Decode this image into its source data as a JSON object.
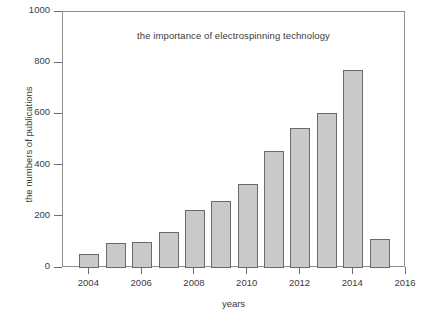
{
  "chart_data": {
    "type": "bar",
    "title": "the importance of electrospinning technology",
    "xlabel": "years",
    "ylabel": "the numbers of publications",
    "categories": [
      2004,
      2005,
      2006,
      2007,
      2008,
      2009,
      2010,
      2011,
      2012,
      2013,
      2014,
      2015
    ],
    "values": [
      55,
      97,
      103,
      140,
      227,
      262,
      330,
      458,
      547,
      605,
      772,
      113
    ],
    "xlim": [
      2003,
      2016
    ],
    "ylim": [
      0,
      1000
    ],
    "yticks": [
      0,
      200,
      400,
      600,
      800,
      1000
    ],
    "ytick_labels": [
      "0",
      "200",
      "400",
      "600",
      "800",
      "1000"
    ],
    "xticks": [
      2004,
      2006,
      2008,
      2010,
      2012,
      2014,
      2016
    ],
    "xtick_labels": [
      "2004",
      "2006",
      "2008",
      "2010",
      "2012",
      "2014",
      "2016"
    ],
    "grid": false,
    "legend": null,
    "bar_fill_color": "#c9c9c9",
    "bar_edge_color": "#6a6a6a",
    "frame_color": "#8f8f8f",
    "text_color": "#3a3a3a",
    "background_color": "#ffffff"
  }
}
